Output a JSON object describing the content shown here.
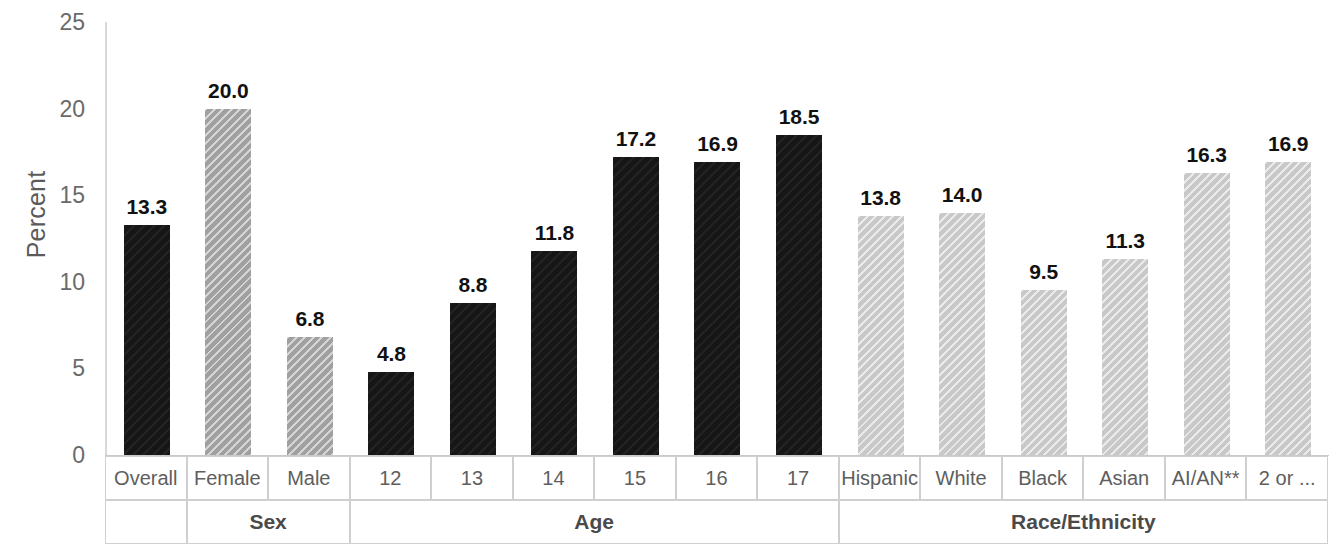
{
  "axis": {
    "y_title": "Percent",
    "y_ticks": [
      "0",
      "5",
      "10",
      "15",
      "20",
      "25"
    ]
  },
  "categories": {
    "labels": [
      "Overall",
      "Female",
      "Male",
      "12",
      "13",
      "14",
      "15",
      "16",
      "17",
      "Hispanic",
      "White",
      "Black",
      "Asian",
      "AI/AN**",
      "2 or ..."
    ],
    "groups": [
      {
        "label": "",
        "span": 1
      },
      {
        "label": "Sex",
        "span": 2
      },
      {
        "label": "Age",
        "span": 6
      },
      {
        "label": "Race/Ethnicity",
        "span": 6
      }
    ]
  },
  "bar_labels": [
    "13.3",
    "20.0",
    "6.8",
    "4.8",
    "8.8",
    "11.8",
    "17.2",
    "16.9",
    "18.5",
    "13.8",
    "14.0",
    "9.5",
    "11.3",
    "16.3",
    "16.9"
  ],
  "colors": {
    "dark_bar": "#161616",
    "mid_bar": "#a0a0a0",
    "light_bar": "#c8c8c8",
    "axis_line": "#d8d8d8",
    "tick_text": "#6a6a6a",
    "table_border": "#cfcfcf",
    "background": "#ffffff"
  },
  "chart_data": {
    "type": "bar",
    "title": "",
    "subtitle": "",
    "xlabel": "",
    "ylabel": "Percent",
    "ylim": [
      0,
      25
    ],
    "yticks": [
      0,
      5,
      10,
      15,
      20,
      25
    ],
    "grid": false,
    "legend": "none",
    "categories": [
      "Overall",
      "Female",
      "Male",
      "12",
      "13",
      "14",
      "15",
      "16",
      "17",
      "Hispanic",
      "White",
      "Black",
      "Asian",
      "AI/AN**",
      "2 or ..."
    ],
    "values": [
      13.3,
      20.0,
      6.8,
      4.8,
      8.8,
      11.8,
      17.2,
      16.9,
      18.5,
      13.8,
      14.0,
      9.5,
      11.3,
      16.3,
      16.9
    ],
    "bar_styles": [
      "dark",
      "mid",
      "mid",
      "dark",
      "dark",
      "dark",
      "dark",
      "dark",
      "dark",
      "light",
      "light",
      "light",
      "light",
      "light",
      "light"
    ],
    "groups": [
      {
        "label": "",
        "categories": [
          "Overall"
        ]
      },
      {
        "label": "Sex",
        "categories": [
          "Female",
          "Male"
        ]
      },
      {
        "label": "Age",
        "categories": [
          "12",
          "13",
          "14",
          "15",
          "16",
          "17"
        ]
      },
      {
        "label": "Race/Ethnicity",
        "categories": [
          "Hispanic",
          "White",
          "Black",
          "Asian",
          "AI/AN**",
          "2 or ..."
        ]
      }
    ],
    "annotations": [
      "13.3",
      "20.0",
      "6.8",
      "4.8",
      "8.8",
      "11.8",
      "17.2",
      "16.9",
      "18.5",
      "13.8",
      "14.0",
      "9.5",
      "11.3",
      "16.3",
      "16.9"
    ]
  }
}
